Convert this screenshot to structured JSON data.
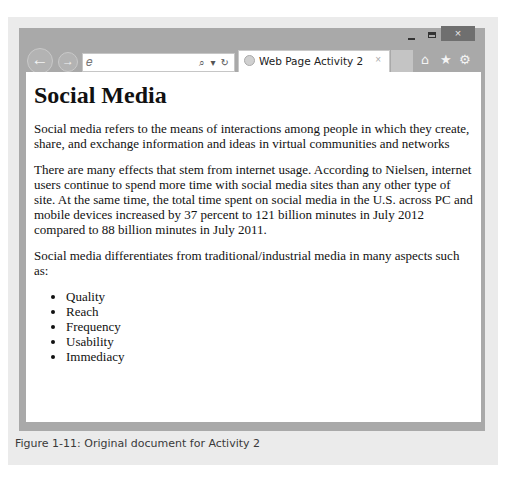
{
  "window": {
    "controls": {
      "minimize": "minimize",
      "maximize": "maximize",
      "close": "×"
    }
  },
  "toolbar": {
    "back_icon": "←",
    "forward_icon": "→",
    "address_value": "",
    "address_tools": "⌕ ▾ ↻",
    "tab_title": "Web Page Activity 2",
    "tab_close": "×",
    "home_icon": "⌂",
    "favorites_icon": "★",
    "settings_icon": "⚙"
  },
  "page": {
    "heading": "Social Media",
    "paragraphs": [
      "Social media refers to the means of interactions among people in which they create, share, and exchange information and ideas in virtual communities and networks",
      "There are many effects that stem from internet usage. According to Nielsen, internet users continue to spend more time with social media sites than any other type of site. At the same time, the total time spent on social media in the U.S. across PC and mobile devices increased by 37 percent to 121 billion minutes in July 2012 compared to 88 billion minutes in July 2011.",
      "Social media differentiates from traditional/industrial media in many aspects such as:"
    ],
    "list": [
      "Quality",
      "Reach",
      "Frequency",
      "Usability",
      "Immediacy"
    ]
  },
  "caption": "Figure 1-11: Original document for Activity 2"
}
